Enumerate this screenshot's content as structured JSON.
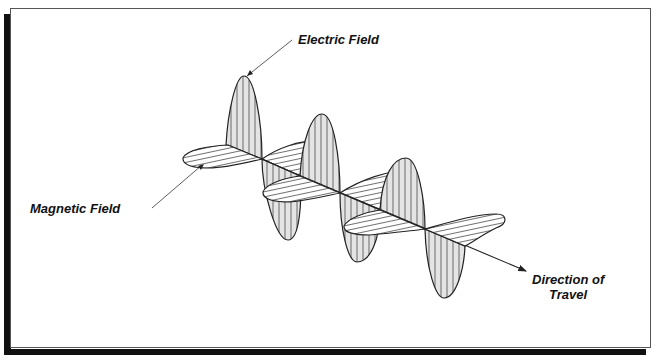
{
  "diagram": {
    "labels": {
      "electric_field": "Electric Field",
      "magnetic_field": "Magnetic Field",
      "direction_line1": "Direction of",
      "direction_line2": "Travel"
    },
    "colors": {
      "stroke": "#222222",
      "fill_electric": "#e6e6e6",
      "fill_magnetic": "#ffffff",
      "frame_shadow": "#111111",
      "background": "#ffffff"
    },
    "components": [
      {
        "name": "electric-field-wave",
        "orientation": "vertical",
        "lobes": 6
      },
      {
        "name": "magnetic-field-wave",
        "orientation": "horizontal",
        "lobes": 6
      },
      {
        "name": "propagation-axis",
        "arrow": true
      }
    ]
  }
}
